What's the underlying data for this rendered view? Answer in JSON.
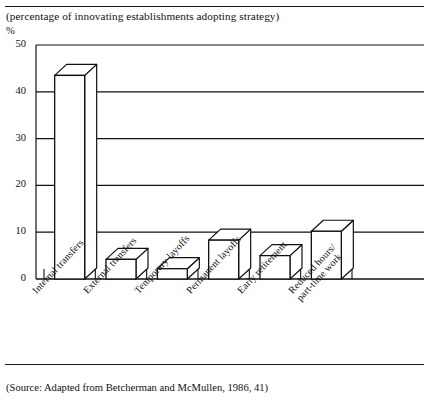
{
  "figure": {
    "subtitle": "(percentage of innovating establishments adopting strategy)",
    "unit_label": "%",
    "source_note": "(Source: Adapted from Betcherman and McMullen, 1986, 41)"
  },
  "chart_data": {
    "type": "bar",
    "title": "",
    "subtitle": "(percentage of innovating establishments adopting strategy)",
    "xlabel": "",
    "ylabel": "%",
    "ylim": [
      0,
      50
    ],
    "yticks": [
      0,
      10,
      20,
      30,
      40,
      50
    ],
    "ytick_labels": [
      "0",
      "10",
      "20",
      "30",
      "40",
      "50"
    ],
    "grid": "horizontal",
    "legend": "none",
    "style": "3d-isometric-bars",
    "categories": [
      "Internal transfers",
      "External transfers",
      "Temporary layoffs",
      "Permanent layoffs",
      "Early retirement",
      "Reduced hours/\npart-time work"
    ],
    "category_lines": [
      [
        "Internal transfers"
      ],
      [
        "External transfers"
      ],
      [
        "Temporary layoffs"
      ],
      [
        "Permanent layoffs"
      ],
      [
        "Early retirement"
      ],
      [
        "Reduced hours/",
        "part-time work"
      ]
    ],
    "values": [
      43.5,
      4.2,
      2.2,
      8.3,
      5.0,
      10.2
    ],
    "bar_fill": "#ffffff",
    "bar_stroke": "#111111"
  },
  "colors": {
    "ink": "#111111",
    "grid": "#333333",
    "paper": "#ffffff"
  }
}
